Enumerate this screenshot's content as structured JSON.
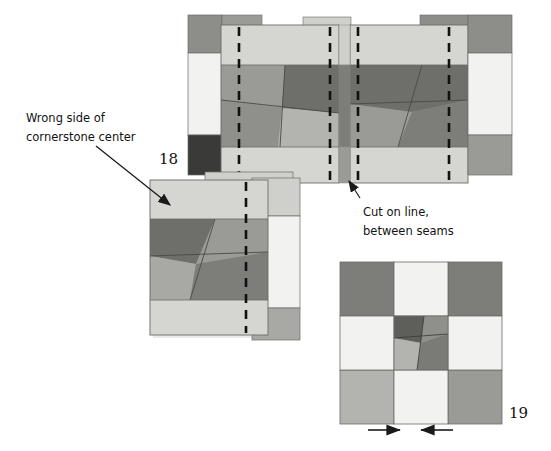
{
  "figure": {
    "annotations": [
      {
        "id": "wrong-side-note",
        "line1": "Wrong side of",
        "line2": "cornerstone center",
        "x": 26,
        "y": 109
      },
      {
        "id": "cut-on-line-note",
        "line1": "Cut on line,",
        "line2": "between seams",
        "x": 363,
        "y": 203
      }
    ],
    "step_numbers": [
      {
        "id": "step-18",
        "text": "18",
        "x": 159,
        "y": 150
      },
      {
        "id": "step-19",
        "text": "19",
        "x": 509,
        "y": 404
      }
    ]
  },
  "palette": {
    "background": "#ffffff",
    "off_white": "#f2f2f0",
    "light_gray": "#cfcfcb",
    "light_gray_2": "#c9c9c5",
    "mid_gray": "#a0a09c",
    "mid_gray_2": "#9a9a96",
    "dark_gray": "#7d7d79",
    "darker_gray": "#6e6e6a",
    "darkest_gray": "#3a3a38",
    "outline": "#6b6b68",
    "hairline": "#8b8b88",
    "dash_line": "#111111",
    "arrow": "#1a1a1a",
    "shadow": "#bdbdba"
  },
  "strip_set": {
    "id": "top-strip-set",
    "description": "Two pieced cornerstone strips shown right sides up with basting seam lines and cut lines",
    "left_panel": {
      "label": "left-pieced-panel",
      "x": 221,
      "y": 25,
      "width": 118,
      "height": 158,
      "top_band": {
        "color": "#d5d5d1",
        "height": 40
      },
      "bottom_band": {
        "color": "#d5d5d1",
        "height": 36
      },
      "pinwheel_colors": [
        "#9a9a96",
        "#6e6e6a",
        "#8f8f8b",
        "#b3b3af"
      ]
    },
    "right_panel": {
      "label": "right-pieced-panel",
      "x": 350,
      "y": 25,
      "width": 118,
      "height": 158,
      "top_band": {
        "color": "#d5d5d1",
        "height": 40
      },
      "bottom_band": {
        "color": "#d5d5d1",
        "height": 36
      },
      "pinwheel_colors": [
        "#8f8f8b",
        "#6e6e6a",
        "#9a9a96",
        "#7d7d79"
      ]
    },
    "left_edge_column": {
      "label": "left-edge-column",
      "x": 188,
      "y": 15,
      "width": 34,
      "height": 160,
      "cells": [
        {
          "name": "corner-dark",
          "color": "#8d8d89",
          "height": 38
        },
        {
          "name": "sashing-light",
          "color": "#f2f2f0",
          "height": 82
        },
        {
          "name": "corner-darkest",
          "color": "#3a3a38",
          "height": 40
        }
      ]
    },
    "right_edge_column": {
      "label": "right-edge-column",
      "x": 468,
      "y": 15,
      "width": 44,
      "height": 160,
      "cells": [
        {
          "name": "corner-dark",
          "color": "#8d8d89",
          "height": 38
        },
        {
          "name": "sashing-light",
          "color": "#f2f2f0",
          "height": 82
        },
        {
          "name": "corner-mid",
          "color": "#9a9a96",
          "height": 40
        }
      ]
    },
    "dash_lines": [
      {
        "name": "seam-line-left-a",
        "x": 239
      },
      {
        "name": "cut-line-left-b",
        "x": 330
      },
      {
        "name": "cut-line-right-a",
        "x": 358
      },
      {
        "name": "seam-line-right-b",
        "x": 449
      }
    ]
  },
  "unit_18": {
    "id": "block-18-wrong-side",
    "description": "Single cut unit turned to show wrong side of cornerstone center, layered over a second unit",
    "front": {
      "x": 150,
      "y": 180,
      "width": 118,
      "height": 155
    },
    "back": {
      "x": 205,
      "y": 172,
      "width": 88,
      "height": 155
    },
    "top_band_color": "#d5d5d1",
    "bottom_band_color": "#d5d5d1",
    "pinwheel_colors": [
      "#6e6e6a",
      "#9a9a96",
      "#a8a8a4",
      "#7d7d79"
    ],
    "dash_line_x": 246
  },
  "unit_19": {
    "id": "block-19-finished",
    "description": "Finished nine-patch cornerstone block with pinwheel center",
    "x": 340,
    "y": 262,
    "size": 162,
    "grid": {
      "corners": {
        "top_left": "#7d7d79",
        "top_right": "#7d7d79",
        "bottom_left": "#b3b3af",
        "bottom_right": "#9a9a96"
      },
      "edges": {
        "top": "#f2f2f0",
        "left": "#f2f2f0",
        "right": "#f2f2f0",
        "bottom": "#f2f2f0"
      },
      "center_pinwheel": [
        "#5e5e5a",
        "#8f8f8b",
        "#b3b3af",
        "#7a7a76"
      ]
    },
    "arrows": [
      {
        "name": "seam-direction-arrow-left",
        "x1": 368,
        "x2": 400,
        "y": 430,
        "direction": "right"
      },
      {
        "name": "seam-direction-arrow-right",
        "x1": 453,
        "x2": 421,
        "y": 430,
        "direction": "left"
      }
    ]
  },
  "leader_lines": [
    {
      "name": "wrong-side-leader",
      "x1": 96,
      "y1": 146,
      "x2": 170,
      "y2": 205
    },
    {
      "name": "cut-line-leader",
      "x1": 360,
      "y1": 198,
      "x2": 348,
      "y2": 180
    }
  ]
}
